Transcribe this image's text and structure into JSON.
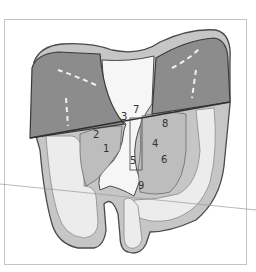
{
  "diagram": {
    "colors": {
      "dark_region": "#8a8a8a",
      "medium_region": "#c2c2c2",
      "light_region": "#e8e8e8",
      "outline": "#4a4a4a",
      "frame": "#bdbdbd"
    },
    "labels": [
      {
        "id": "1",
        "text": "1"
      },
      {
        "id": "2",
        "text": "2"
      },
      {
        "id": "3",
        "text": "3"
      },
      {
        "id": "4",
        "text": "4"
      },
      {
        "id": "5",
        "text": "5"
      },
      {
        "id": "6",
        "text": "6"
      },
      {
        "id": "7",
        "text": "7"
      },
      {
        "id": "8",
        "text": "8"
      },
      {
        "id": "9",
        "text": "9"
      }
    ]
  }
}
